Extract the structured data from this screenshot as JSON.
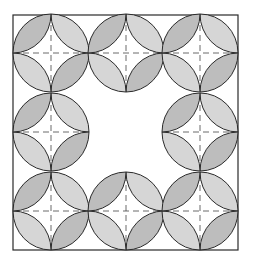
{
  "figure": {
    "colors": {
      "background": "#ffffff",
      "stroke": "#2a2a2a",
      "petal_fill": "#d6d6d6",
      "petal_fill_dark": "#bdbdbd",
      "dash": "#444444"
    },
    "frame": {
      "x": 13,
      "y": 15,
      "w": 225,
      "h": 235
    },
    "grid": {
      "cols": 3,
      "rows": 3,
      "omit_center": true
    },
    "centers_x": [
      51,
      126,
      200
    ],
    "centers_y": [
      53,
      132,
      211
    ],
    "radius_x": 38,
    "radius_y": 39
  }
}
